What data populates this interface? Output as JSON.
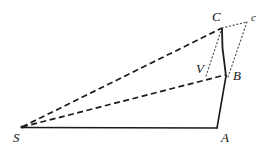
{
  "figure": {
    "background_color": "#ffffff",
    "stroke_color": "#1a1a1a",
    "width": 273,
    "height": 149
  },
  "points": {
    "S": {
      "label": "S",
      "x": 22,
      "y": 127,
      "label_x": 13,
      "label_y": 131
    },
    "A": {
      "label": "A",
      "x": 217,
      "y": 128,
      "label_x": 221,
      "label_y": 131
    },
    "B": {
      "label": "B",
      "x": 225,
      "y": 75,
      "label_x": 233,
      "label_y": 69
    },
    "C": {
      "label": "C",
      "x": 222,
      "y": 28,
      "label_x": 212,
      "label_y": 10
    },
    "c": {
      "label": "c",
      "x": 247,
      "y": 22,
      "label_x": 251,
      "label_y": 10
    },
    "V": {
      "label": "V",
      "x": 209,
      "y": 74,
      "label_x": 196,
      "label_y": 62
    }
  },
  "edges": {
    "solid": [
      {
        "name": "base-S-A",
        "from": "S",
        "to": "A"
      },
      {
        "name": "side-A-B",
        "from": "A",
        "to": "B"
      },
      {
        "name": "side-B-C",
        "from": "B",
        "to": "C"
      }
    ],
    "dashed": [
      {
        "name": "ray-S-C",
        "from": "S",
        "to": "C"
      },
      {
        "name": "ray-S-B",
        "from": "S",
        "to": "B"
      }
    ],
    "dotted": [
      {
        "name": "guide-C-c",
        "from": "C",
        "to": "c"
      },
      {
        "name": "guide-C-V",
        "from": "C",
        "to": "V"
      },
      {
        "name": "guide-c-B",
        "from": "c",
        "to": "B"
      }
    ]
  },
  "style": {
    "solid_width": 1.6,
    "dashed_width": 1.7,
    "dotted_width": 1.2,
    "dash_pattern": "6 3.5",
    "dot_pattern": "1.2 2.6"
  }
}
